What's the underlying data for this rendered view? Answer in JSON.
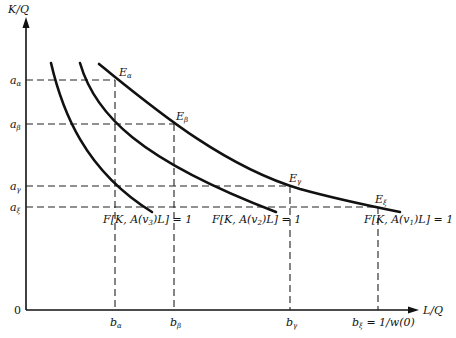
{
  "axes": {
    "y_label": "K/Q",
    "x_label": "L/Q",
    "origin": "0"
  },
  "y_ticks": [
    {
      "base": "a",
      "sub": "α",
      "y": 80
    },
    {
      "base": "a",
      "sub": "β",
      "y": 124
    },
    {
      "base": "a",
      "sub": "γ",
      "y": 186
    },
    {
      "base": "a",
      "sub": "ξ",
      "y": 207
    }
  ],
  "x_ticks": [
    {
      "base": "b",
      "sub": "α",
      "x": 115,
      "suffix": ""
    },
    {
      "base": "b",
      "sub": "β",
      "x": 174,
      "suffix": ""
    },
    {
      "base": "b",
      "sub": "γ",
      "x": 290,
      "suffix": ""
    },
    {
      "base": "b",
      "sub": "ξ",
      "x": 378,
      "suffix": " = 1/w(0)"
    }
  ],
  "points": [
    {
      "base": "E",
      "sub": "α",
      "x": 115,
      "y": 80
    },
    {
      "base": "E",
      "sub": "β",
      "x": 174,
      "y": 124
    },
    {
      "base": "E",
      "sub": "γ",
      "x": 290,
      "y": 186
    },
    {
      "base": "E",
      "sub": "ξ",
      "x": 378,
      "y": 207
    }
  ],
  "curves": [
    {
      "name": "isoquant-v3",
      "pre": "F[K, A(v",
      "sub": "3",
      "post": ")L] = 1"
    },
    {
      "name": "isoquant-v2",
      "pre": "F[K, A(v",
      "sub": "2",
      "post": ")L] = 1"
    },
    {
      "name": "isoquant-v1",
      "pre": "F[K, A(v",
      "sub": "1",
      "post": ")L] = 1"
    }
  ]
}
